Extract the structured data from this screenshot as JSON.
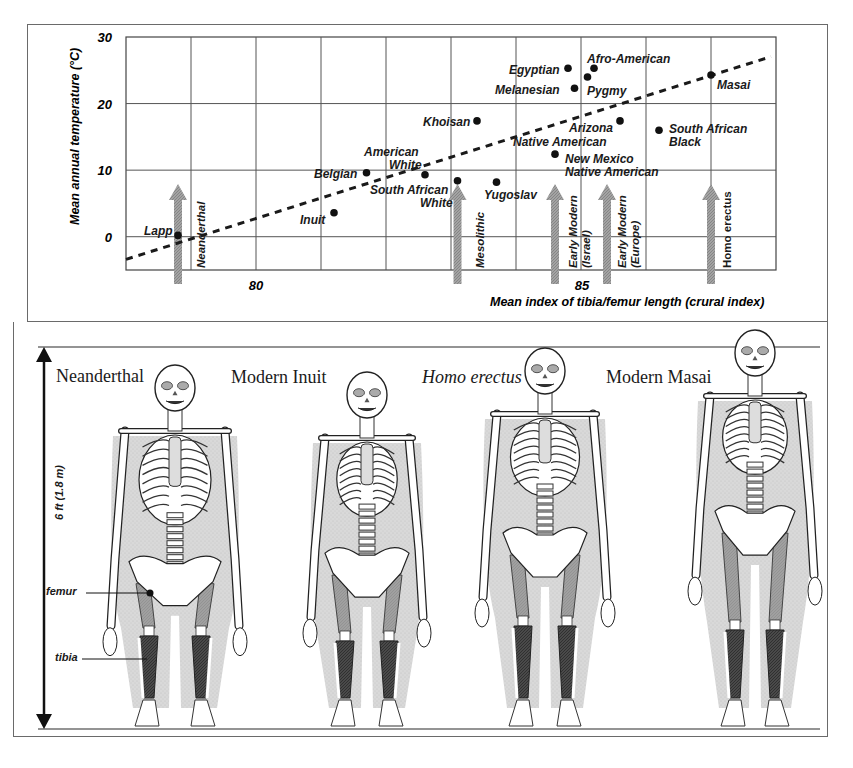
{
  "chart_data": {
    "type": "scatter",
    "title": "",
    "xlabel": "Mean index of tibia/femur length (crural index)",
    "ylabel": "Mean annual temperature (°C)",
    "xlim": [
      78,
      88
    ],
    "ylim": [
      -5,
      30
    ],
    "x_ticks": [
      80,
      85
    ],
    "y_ticks": [
      0,
      10,
      20,
      30
    ],
    "grid": true,
    "x_grid_step": 1,
    "y_grid_step": 10,
    "trendline": {
      "style": "dashed",
      "from": [
        78,
        -3.4
      ],
      "to": [
        88,
        27.5
      ]
    },
    "points": [
      {
        "label": "Lapp",
        "x": 78.8,
        "y": 0.2
      },
      {
        "label": "Inuit",
        "x": 81.2,
        "y": 3.6
      },
      {
        "label": "Belgian",
        "x": 81.7,
        "y": 9.6
      },
      {
        "label": "American White",
        "x": 82.6,
        "y": 9.3
      },
      {
        "label": "South African White",
        "x": 83.1,
        "y": 8.4
      },
      {
        "label": "Yugoslav",
        "x": 83.7,
        "y": 8.2
      },
      {
        "label": "Khoisan",
        "x": 83.4,
        "y": 17.4
      },
      {
        "label": "Egyptian",
        "x": 84.8,
        "y": 25.3
      },
      {
        "label": "Afro-American",
        "x": 85.2,
        "y": 25.3
      },
      {
        "label": "Pygmy",
        "x": 85.1,
        "y": 24.0
      },
      {
        "label": "Melanesian",
        "x": 84.9,
        "y": 22.3
      },
      {
        "label": "Arizona Native American",
        "x": 85.6,
        "y": 17.4
      },
      {
        "label": "New Mexico Native American",
        "x": 84.6,
        "y": 12.4
      },
      {
        "label": "South African Black",
        "x": 86.2,
        "y": 16.0
      },
      {
        "label": "Masai",
        "x": 87.0,
        "y": 24.3
      }
    ],
    "fossil_markers": [
      {
        "label": "Neanderthal",
        "x": 78.8
      },
      {
        "label": "Mesolithic",
        "x": 83.1
      },
      {
        "label": "Early Modern (Israel)",
        "x": 84.6
      },
      {
        "label": "Early Modern (Europe)",
        "x": 85.4
      },
      {
        "label": "Homo erectus",
        "x": 87.0
      }
    ]
  },
  "chart_labels": {
    "ylabel": "Mean annual temperature (°C)",
    "xlabel": "Mean index of tibia/femur length (crural index)",
    "y_ticks": [
      "30",
      "20",
      "10",
      "0"
    ],
    "x_ticks": [
      "80",
      "85"
    ],
    "point_labels": {
      "lapp": "Lapp",
      "inuit": "Inuit",
      "belgian": "Belgian",
      "american_white_1": "American",
      "american_white_2": "White",
      "sa_white_1": "South African",
      "sa_white_2": "White",
      "yugoslav": "Yugoslav",
      "khoisan": "Khoisan",
      "egyptian": "Egyptian",
      "afro_american": "Afro-American",
      "pygmy": "Pygmy",
      "melanesian": "Melanesian",
      "arizona_1": "Arizona",
      "arizona_2": "Native American",
      "nm_1": "New Mexico",
      "nm_2": "Native American",
      "sa_black_1": "South African",
      "sa_black_2": "Black",
      "masai": "Masai"
    },
    "marker_labels": {
      "neanderthal": "Neanderthal",
      "mesolithic": "Mesolithic",
      "em_israel_1": "Early Modern",
      "em_israel_2": "(Israel)",
      "em_europe_1": "Early Modern",
      "em_europe_2": "(Europe)",
      "homo_erectus": "Homo erectus"
    }
  },
  "figure": {
    "skeletons": [
      {
        "name": "Neanderthal",
        "italic": false
      },
      {
        "name": "Modern Inuit",
        "italic": false
      },
      {
        "name": "Homo erectus",
        "italic": true
      },
      {
        "name": "Modern Masai",
        "italic": false
      }
    ],
    "scale_label": "6 ft (1.8 m)",
    "callouts": {
      "femur": "femur",
      "tibia": "tibia"
    }
  },
  "colors": {
    "ink": "#1a1a1a",
    "grid": "#555555",
    "arrow": "#9a9a9a",
    "femur": "#9e9e9e",
    "tibia": "#4a4a4a",
    "flesh": "#cfcfcf",
    "bone": "#ffffff"
  }
}
